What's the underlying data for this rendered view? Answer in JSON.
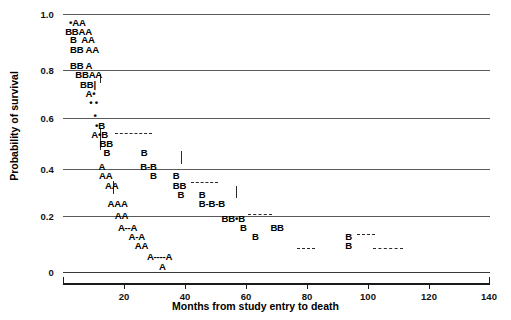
{
  "chart_data": {
    "type": "scatter",
    "title": "",
    "xlabel": "Months from study entry to death",
    "ylabel": "Probability of survival",
    "xlim": [
      0,
      140
    ],
    "ylim": [
      0,
      1.0
    ],
    "xticks": [
      "0",
      "20",
      "40",
      "60",
      "80",
      "100",
      "120",
      "140"
    ],
    "xtick_values": [
      0,
      20,
      40,
      60,
      80,
      100,
      120,
      140
    ],
    "yticks": [
      "1.0",
      "0.8",
      "0.6",
      "0.4",
      "0.2",
      "0"
    ],
    "ytick_values": [
      1.0,
      0.8,
      0.6,
      0.4,
      0.2,
      0
    ],
    "grid": true,
    "legend": "none",
    "series": [
      {
        "name": "A",
        "marker": "A",
        "description": "Group A survival step points"
      },
      {
        "name": "B",
        "marker": "B",
        "description": "Group B survival step points"
      },
      {
        "name": "censored",
        "marker": "dot",
        "description": "Censored observations shown as filled dots"
      }
    ],
    "marks": [
      {
        "text": "•AA",
        "x": 2.0,
        "y": 0.965
      },
      {
        "text": "BBAA",
        "x": 0.7,
        "y": 0.932
      },
      {
        "text": "B  AA",
        "x": 2.3,
        "y": 0.898
      },
      {
        "text": "BB AA",
        "x": 2.3,
        "y": 0.862
      },
      {
        "text": "BB A",
        "x": 2.3,
        "y": 0.8
      },
      {
        "text": "BBAA",
        "x": 4.0,
        "y": 0.762
      },
      {
        "text": "BB|",
        "x": 5.6,
        "y": 0.726
      },
      {
        "text": "A•",
        "x": 7.4,
        "y": 0.69
      },
      {
        "text": "• •",
        "x": 8.6,
        "y": 0.655
      },
      {
        "text": "•",
        "x": 10.0,
        "y": 0.605
      },
      {
        "text": "•B",
        "x": 10.5,
        "y": 0.565
      },
      {
        "text": "A•B",
        "x": 9.3,
        "y": 0.53
      },
      {
        "text": "BB",
        "x": 12.0,
        "y": 0.495
      },
      {
        "text": "B",
        "x": 13.3,
        "y": 0.46
      },
      {
        "text": "B",
        "x": 25.5,
        "y": 0.46
      },
      {
        "text": "A",
        "x": 11.6,
        "y": 0.408
      },
      {
        "text": "B-B",
        "x": 25.3,
        "y": 0.408
      },
      {
        "text": "AA",
        "x": 11.8,
        "y": 0.372
      },
      {
        "text": "B",
        "x": 28.5,
        "y": 0.372
      },
      {
        "text": "B",
        "x": 36.0,
        "y": 0.372
      },
      {
        "text": "AA",
        "x": 13.8,
        "y": 0.335
      },
      {
        "text": "BB",
        "x": 36.0,
        "y": 0.335
      },
      {
        "text": "B",
        "x": 37.5,
        "y": 0.3
      },
      {
        "text": "B",
        "x": 44.5,
        "y": 0.3
      },
      {
        "text": "AAA",
        "x": 14.6,
        "y": 0.262
      },
      {
        "text": "B-B-B",
        "x": 44.5,
        "y": 0.262
      },
      {
        "text": "AA",
        "x": 17.0,
        "y": 0.218
      },
      {
        "text": "BB•B",
        "x": 52.0,
        "y": 0.205
      },
      {
        "text": "A--A",
        "x": 18.0,
        "y": 0.172
      },
      {
        "text": "B",
        "x": 58.0,
        "y": 0.172
      },
      {
        "text": "BB",
        "x": 68.0,
        "y": 0.172
      },
      {
        "text": "A-A",
        "x": 21.5,
        "y": 0.137
      },
      {
        "text": "B",
        "x": 62.0,
        "y": 0.137
      },
      {
        "text": "B",
        "x": 92.5,
        "y": 0.137
      },
      {
        "text": "AA",
        "x": 23.5,
        "y": 0.102
      },
      {
        "text": "B",
        "x": 92.5,
        "y": 0.102
      },
      {
        "text": "A----A",
        "x": 27.5,
        "y": 0.06
      },
      {
        "text": "A",
        "x": 31.5,
        "y": 0.018
      }
    ]
  },
  "axes": {
    "y_title": "Probability of survival",
    "x_title": "Months from study entry to death",
    "y_labels": [
      "1.0",
      "0.8",
      "0.6",
      "0.4",
      "0.2",
      "0"
    ],
    "x_labels": [
      "20",
      "40",
      "60",
      "80",
      "100",
      "120",
      "140"
    ]
  }
}
